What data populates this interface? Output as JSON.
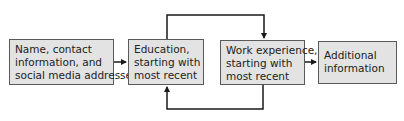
{
  "diagram": {
    "type": "flowchart",
    "boxes": [
      {
        "id": "contact",
        "lines": [
          "Name, contact",
          "information, and",
          "social media addresses"
        ]
      },
      {
        "id": "education",
        "lines": [
          "Education,",
          "starting with",
          "most recent"
        ]
      },
      {
        "id": "work",
        "lines": [
          "Work experience,",
          "starting with",
          "most recent"
        ]
      },
      {
        "id": "additional",
        "lines": [
          "Additional",
          "information"
        ]
      }
    ],
    "connections": [
      {
        "from": "contact",
        "to": "education"
      },
      {
        "from": "education",
        "to": "work",
        "route": "over-top"
      },
      {
        "from": "work",
        "to": "education",
        "route": "under-bottom"
      },
      {
        "from": "work",
        "to": "additional"
      }
    ],
    "colors": {
      "box_fill": "#e3e3e3",
      "box_border": "#5a5a5a",
      "line": "#1a1a1a"
    }
  }
}
